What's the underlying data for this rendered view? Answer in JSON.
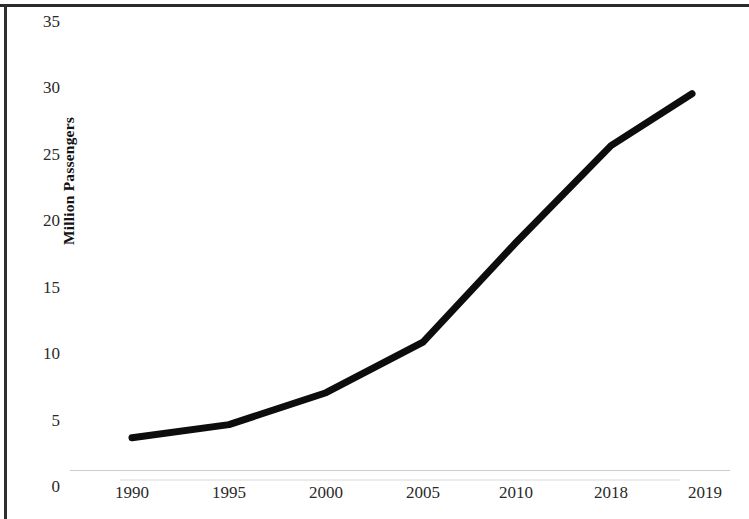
{
  "chart_data": {
    "type": "line",
    "title": "",
    "xlabel": "",
    "ylabel": "Million Passengers",
    "categories": [
      "1990",
      "1995",
      "2000",
      "2005",
      "2010",
      "2018",
      "2019"
    ],
    "values": [
      3.7,
      4.7,
      7.1,
      10.9,
      18.4,
      25.7,
      29.6
    ],
    "series": [
      {
        "name": "Million Passengers",
        "values": [
          3.7,
          4.7,
          7.1,
          10.9,
          18.4,
          25.7,
          29.6
        ]
      }
    ],
    "ylim": [
      0,
      35
    ],
    "yticks": [
      0,
      5,
      10,
      15,
      20,
      25,
      30,
      35
    ],
    "ytick_labels": [
      "0",
      "5",
      "10",
      "15",
      "20",
      "25",
      "30",
      "35"
    ],
    "xtick_labels": [
      "1990",
      "1995",
      "2000",
      "2005",
      "2010",
      "2018",
      "2019"
    ],
    "grid": false,
    "legend": false,
    "legend_position": "none",
    "line_color": "#0d0d0d",
    "line_width": 7,
    "markers": false,
    "background_color": "#ffffff"
  },
  "axes": {
    "y_axis_title": "Million Passengers",
    "y_tick_labels": [
      "35",
      "30",
      "25",
      "20",
      "15",
      "10",
      "5",
      "0"
    ],
    "x_tick_labels": [
      "1990",
      "1995",
      "2000",
      "2005",
      "2010",
      "2018",
      "2019"
    ]
  }
}
